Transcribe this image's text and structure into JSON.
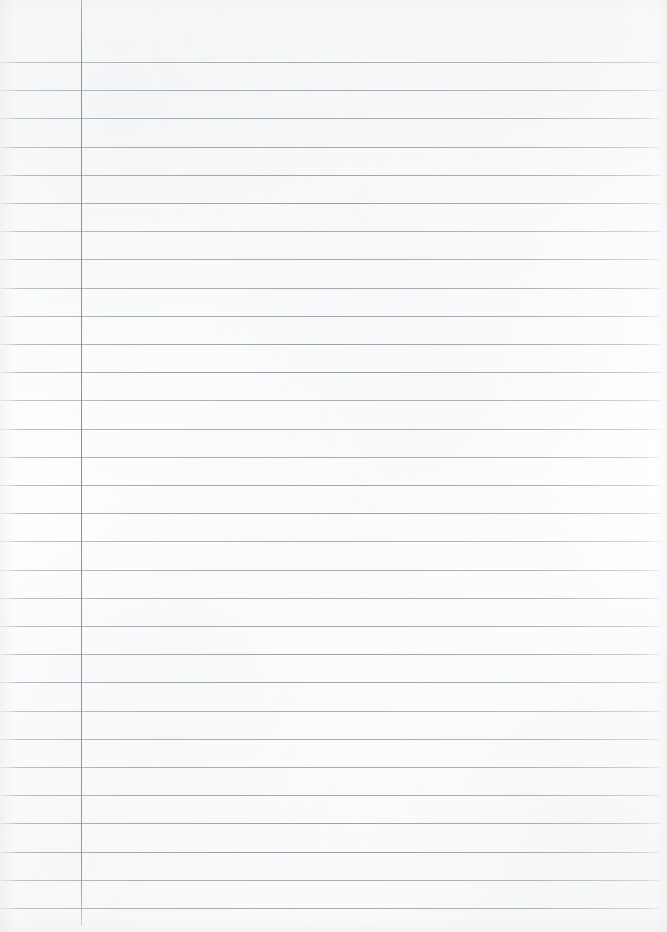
{
  "page": {
    "kind": "lined-notebook-paper",
    "width_px": 667,
    "height_px": 932,
    "paper_color": "#fdfdfc",
    "content_text": "",
    "has_handwriting": false
  },
  "ruling": {
    "line_color": "#969ca0",
    "line_thickness_px": 1,
    "first_line_y": 62,
    "line_spacing_px": 28.2,
    "line_count": 31,
    "line_start_x": 0,
    "line_end_x": 661,
    "lines_y": [
      62,
      90.2,
      118.4,
      146.6,
      174.8,
      203,
      231.2,
      259.4,
      287.6,
      315.8,
      344,
      372.2,
      400.4,
      428.6,
      456.8,
      485,
      513.2,
      541.4,
      569.6,
      597.8,
      626,
      654.2,
      682.4,
      710.6,
      738.8,
      767,
      795.2,
      823.4,
      851.6,
      879.8,
      908
    ]
  },
  "margin_rule": {
    "color": "#8a8f97",
    "x": 81,
    "top_y": 0,
    "bottom_y": 926,
    "thickness_px": 1,
    "orientation": "vertical"
  }
}
